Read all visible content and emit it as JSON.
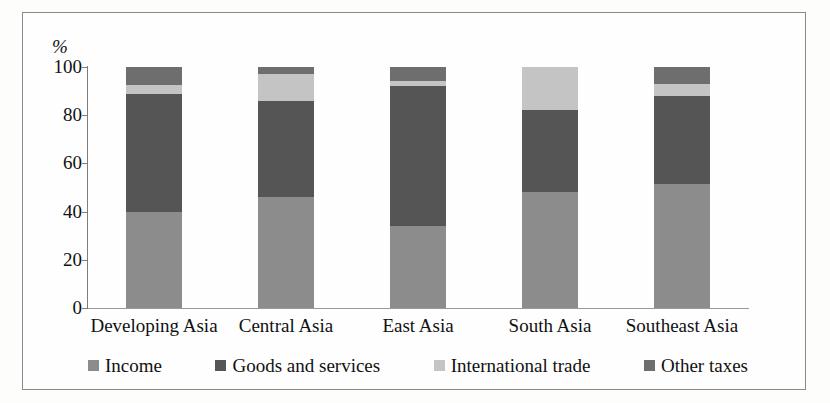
{
  "chart_data": {
    "type": "bar",
    "subtype": "stacked-bar-100",
    "title": "",
    "xlabel": "",
    "ylabel": "%",
    "ylim": [
      0,
      100
    ],
    "yticks": [
      0,
      20,
      40,
      60,
      80,
      100
    ],
    "grid": false,
    "legend_position": "bottom",
    "categories": [
      "Developing Asia",
      "Central Asia",
      "East Asia",
      "South Asia",
      "Southeast Asia"
    ],
    "series": [
      {
        "name": "Income",
        "color": "#8c8c8c",
        "values": [
          40,
          46,
          34,
          48,
          51.5
        ]
      },
      {
        "name": "Goods and services",
        "color": "#555555",
        "values": [
          49,
          40,
          58,
          34,
          36.5
        ]
      },
      {
        "name": "International trade",
        "color": "#c4c4c4",
        "values": [
          3.5,
          11,
          2,
          18,
          5
        ]
      },
      {
        "name": "Other taxes",
        "color": "#6e6e6e",
        "values": [
          7.5,
          3,
          6,
          0,
          7
        ]
      }
    ]
  },
  "axis": {
    "unit_label": "%",
    "tick_labels": [
      "100",
      "80",
      "60",
      "40",
      "20",
      "0"
    ]
  },
  "legend": {
    "items": [
      {
        "label": "Income",
        "swatch": "#8c8c8c"
      },
      {
        "label": "Goods and services",
        "swatch": "#555555"
      },
      {
        "label": "International trade",
        "swatch": "#c4c4c4"
      },
      {
        "label": "Other taxes",
        "swatch": "#6e6e6e"
      }
    ]
  }
}
